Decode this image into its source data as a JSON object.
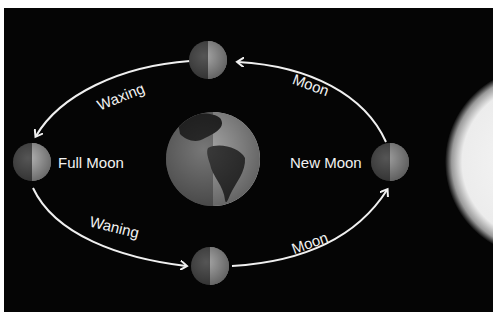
{
  "diagram": {
    "labels": {
      "waxing": "Waxing",
      "waning": "Waning",
      "moon_top": "Moon",
      "moon_bottom": "Moon",
      "full_moon": "Full Moon",
      "new_moon": "New Moon"
    },
    "bodies": {
      "earth": "Earth",
      "sun": "Sun",
      "moons": [
        "top-moon",
        "full-moon",
        "bottom-moon",
        "new-moon"
      ]
    },
    "colors": {
      "background": "#050505",
      "arrow": "#f0f0f0",
      "text": "#f2f2f2",
      "moon_dark": "#555555",
      "moon_light": "#a8a8a8",
      "sun": "#f4f4f4"
    }
  }
}
